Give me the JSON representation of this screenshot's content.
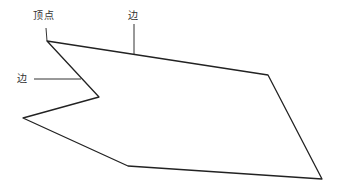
{
  "diagram": {
    "type": "polygon-parts",
    "colors": {
      "background": "#ffffff",
      "stroke": "#222222",
      "label": "#333333",
      "leader": "#333333"
    },
    "polygon": {
      "points": "47,41 268,75 322,179 128,166 23,118 99,97",
      "stroke_width": 1.3
    },
    "leaders": [
      {
        "name": "vertex-leader",
        "x1": 46,
        "y1": 28,
        "x2": 47,
        "y2": 41
      },
      {
        "name": "top-edge-leader",
        "x1": 134,
        "y1": 24,
        "x2": 134,
        "y2": 54
      },
      {
        "name": "left-edge-leader",
        "x1": 34,
        "y1": 79,
        "x2": 81,
        "y2": 79
      }
    ],
    "labels": {
      "vertex": {
        "text": "顶点",
        "x": 33,
        "y": 11
      },
      "top_edge": {
        "text": "边",
        "x": 128,
        "y": 11
      },
      "left_edge": {
        "text": "边",
        "x": 17,
        "y": 74
      }
    }
  }
}
